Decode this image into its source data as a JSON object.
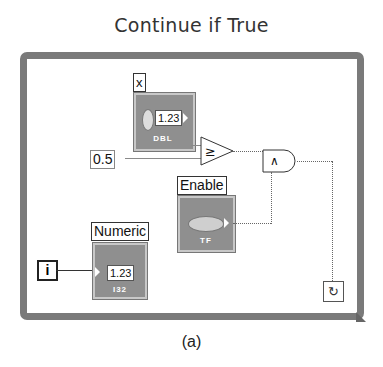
{
  "title": "Continue if True",
  "caption": "(a)",
  "diagram": {
    "loop_type": "While Loop",
    "nodes": {
      "x_control": {
        "label": "x",
        "value": "1.23",
        "type": "DBL"
      },
      "constant": {
        "value": "0.5"
      },
      "compare": {
        "symbol": "≥"
      },
      "and_gate": {
        "symbol": "∧"
      },
      "enable_control": {
        "label": "Enable",
        "type": "TF"
      },
      "iteration": {
        "symbol": "i"
      },
      "numeric_indicator": {
        "label": "Numeric",
        "value": "1.23",
        "type": "I32"
      },
      "loop_condition": {
        "symbol": "↻"
      }
    }
  },
  "colors": {
    "frame": "#7a7a7a",
    "control_fill": "#8f8f8f",
    "wire": "#8a8a8a"
  }
}
